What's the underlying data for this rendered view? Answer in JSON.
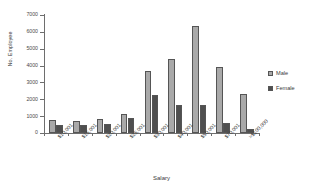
{
  "chart_data": {
    "type": "bar",
    "title": "",
    "xlabel": "Salary",
    "ylabel": "No. Employee",
    "ylim": [
      0,
      7000
    ],
    "yticks": [
      0,
      1000,
      2000,
      3000,
      4000,
      5000,
      6000,
      7000
    ],
    "ytick_labels": [
      "0",
      "1000",
      "2000",
      "3000",
      "4000",
      "5000",
      "6000",
      "7000"
    ],
    "grid": false,
    "legend_position": "right",
    "categories": [
      "$10,001",
      "$15,001",
      "$20,001",
      "$25,001",
      "$30,001",
      "$40,001",
      "$50,001",
      "$70,001",
      ">$100,000"
    ],
    "series": [
      {
        "name": "Male",
        "color": "#a9a9a9",
        "values": [
          780,
          730,
          840,
          1130,
          3700,
          4370,
          6350,
          3910,
          2330
        ]
      },
      {
        "name": "Female",
        "color": "#4f4f4f",
        "values": [
          450,
          480,
          540,
          910,
          2250,
          1660,
          1640,
          620,
          230
        ]
      }
    ]
  }
}
